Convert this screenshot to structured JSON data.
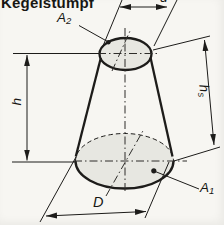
{
  "title": "Kegelstumpf",
  "figure": {
    "type": "technical-diagram",
    "labels": {
      "top_diameter": "d",
      "height": "h",
      "slant_height_base": "h",
      "slant_height_sub": "s",
      "base_diameter": "D",
      "top_area_base": "A",
      "top_area_sub": "2",
      "base_area_base": "A",
      "base_area_sub": "1"
    },
    "colors": {
      "background": "#f7f6f2",
      "line": "#1d1c1a",
      "centerline": "#2e2d2a",
      "face_fill": "#e7e7e1",
      "text": "#171714"
    }
  }
}
